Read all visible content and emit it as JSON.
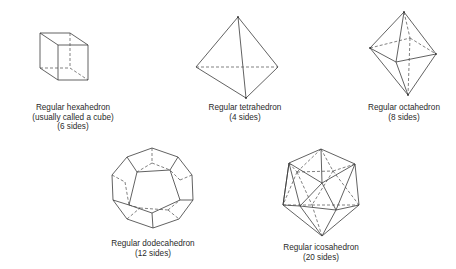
{
  "figures": [
    {
      "id": "hexahedron",
      "name": "Regular hexahedron",
      "lines": [
        "Regular hexahedron",
        "(usually called a cube)",
        "(6 sides)"
      ],
      "sides": 6
    },
    {
      "id": "tetrahedron",
      "name": "Regular tetrahedron",
      "lines": [
        "Regular tetrahedron",
        "(4 sides)"
      ],
      "sides": 4
    },
    {
      "id": "octahedron",
      "name": "Regular octahedron",
      "lines": [
        "Regular octahedron",
        "(8 sides)"
      ],
      "sides": 8
    },
    {
      "id": "dodecahedron",
      "name": "Regular dodecahedron",
      "lines": [
        "Regular dodecahedron",
        "(12 sides)"
      ],
      "sides": 12
    },
    {
      "id": "icosahedron",
      "name": "Regular icosahedron",
      "lines": [
        "Regular icosahedron",
        "(20 sides)"
      ],
      "sides": 20
    }
  ],
  "colors": {
    "line": "#3a3a3a",
    "text": "#2a2a2a",
    "background": "#ffffff"
  }
}
